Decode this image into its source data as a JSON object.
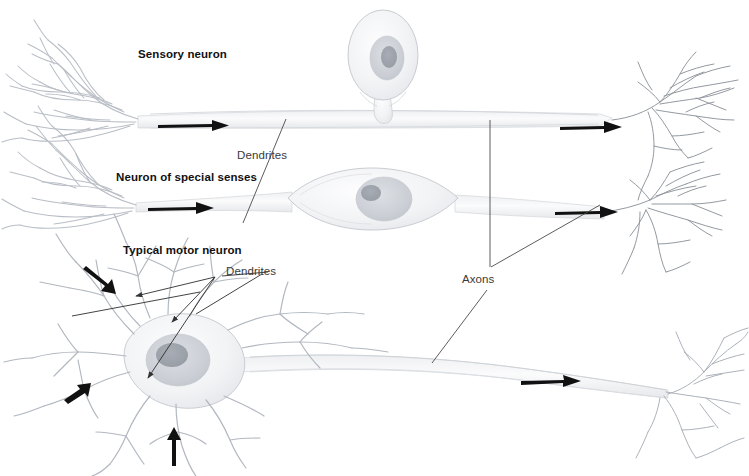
{
  "figure": {
    "title_alt": "Types of neurons",
    "background_color": "#ffffff",
    "labels": {
      "sensory_neuron": "Sensory neuron",
      "special_senses_neuron": "Neuron of special senses",
      "motor_neuron": "Typical motor neuron",
      "dendrites_upper": "Dendrites",
      "dendrites_lower": "Dendrites",
      "axons": "Axons"
    },
    "colors": {
      "bold_text": "#111111",
      "plain_text": "#3a3a3a",
      "leader_line": "#444444",
      "arrow": "#111111",
      "cell_outline": "#c9cdd2",
      "cell_fill": "#f4f5f7",
      "nucleus": "#d5d8dd",
      "nucleolus": "#a9aeb5",
      "dendrite_stroke": "#b9bec6"
    },
    "rows": [
      {
        "name": "sensory-neuron-row",
        "label": "Sensory neuron",
        "soma_shape": "pear",
        "soma_position": "top-center",
        "conduction_arrows": 2,
        "arrow_direction": "right"
      },
      {
        "name": "special-senses-neuron-row",
        "label": "Neuron of special senses",
        "soma_shape": "spindle",
        "soma_position": "inline-center",
        "conduction_arrows": 2,
        "arrow_direction": "right"
      },
      {
        "name": "motor-neuron-row",
        "label": "Typical motor neuron",
        "soma_shape": "multipolar",
        "soma_position": "left",
        "conduction_arrows": 4,
        "arrow_direction": "mixed"
      }
    ],
    "arrows": [
      {
        "name": "arrow-sensory-dendrite",
        "direction": "right"
      },
      {
        "name": "arrow-sensory-axon",
        "direction": "right"
      },
      {
        "name": "arrow-special-dendrite",
        "direction": "right"
      },
      {
        "name": "arrow-special-axon",
        "direction": "right"
      },
      {
        "name": "arrow-motor-dendrite-upper",
        "direction": "down-right"
      },
      {
        "name": "arrow-motor-dendrite-lower",
        "direction": "up-right"
      },
      {
        "name": "arrow-motor-dendrite-bottom",
        "direction": "up"
      },
      {
        "name": "arrow-motor-axon",
        "direction": "right"
      }
    ]
  }
}
